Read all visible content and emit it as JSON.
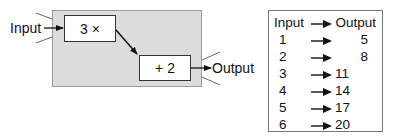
{
  "machine": {
    "input_label": "Input",
    "output_label": "Output",
    "operations": [
      {
        "label": "3 ×"
      },
      {
        "label": "+ 2"
      }
    ]
  },
  "table": {
    "header": {
      "input": "Input",
      "output": "Output"
    },
    "rows": [
      {
        "input": "1",
        "output": "5"
      },
      {
        "input": "2",
        "output": "8"
      },
      {
        "input": "3",
        "output": "11"
      },
      {
        "input": "4",
        "output": "14"
      },
      {
        "input": "5",
        "output": "17"
      },
      {
        "input": "6",
        "output": "20"
      }
    ]
  },
  "colors": {
    "machine_fill": "#dcdcdc",
    "machine_border": "#9a9a9a",
    "line": "#111111"
  }
}
